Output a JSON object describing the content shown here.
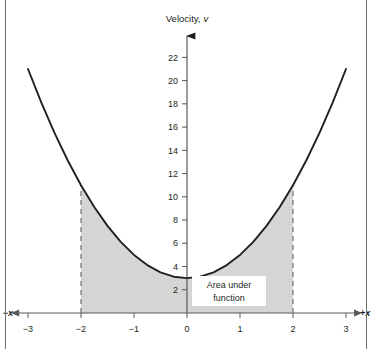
{
  "figure": {
    "background_color": "#ffffff",
    "frame_color": "#6e6e6e",
    "curve_color": "#231f20",
    "shade_color": "#d5d5d5",
    "axis_color": "#6e6e6e",
    "dashed_color": "#808080"
  },
  "chart_data": {
    "type": "line",
    "title_plain": "Velocity,",
    "title_symbol": "v",
    "xlabel_negative": "−x",
    "xlabel_positive": "+x",
    "ylabel": "Velocity, v",
    "grid": false,
    "legend": "none",
    "xlim": [
      -3.5,
      3.5
    ],
    "ylim": [
      0,
      23.5
    ],
    "xticks": [
      -3,
      -2,
      -1,
      0,
      1,
      2,
      3
    ],
    "xtick_labels": [
      "−3",
      "−2",
      "−1",
      "0",
      "1",
      "2",
      "3"
    ],
    "yticks": [
      2,
      4,
      6,
      8,
      10,
      12,
      14,
      16,
      18,
      20,
      22
    ],
    "ytick_labels": [
      "2",
      "4",
      "6",
      "8",
      "10",
      "12",
      "14",
      "16",
      "18",
      "20",
      "22"
    ],
    "function": "v = 2x² + 3",
    "x": [
      -3,
      -2.75,
      -2.5,
      -2.25,
      -2,
      -1.75,
      -1.5,
      -1.25,
      -1,
      -0.75,
      -0.5,
      -0.25,
      0,
      0.25,
      0.5,
      0.75,
      1,
      1.25,
      1.5,
      1.75,
      2,
      2.25,
      2.5,
      2.75,
      3
    ],
    "y": [
      21,
      18.125,
      15.5,
      13.125,
      11,
      9.125,
      7.5,
      6.125,
      5,
      4.125,
      3.5,
      3.125,
      3,
      3.125,
      3.5,
      4.125,
      5,
      6.125,
      7.5,
      9.125,
      11,
      13.125,
      15.5,
      18.125,
      21
    ],
    "shaded_region": {
      "label_line1": "Area under",
      "label_line2": "function",
      "x_from": -2,
      "x_to": 2,
      "boundary_type": "dashed-vertical",
      "boundary_values": [
        -2,
        2
      ],
      "boundary_heights": [
        11,
        11
      ]
    },
    "annotations": [
      {
        "text": "Area under function",
        "x": 1.0,
        "y": 2.1
      }
    ]
  }
}
